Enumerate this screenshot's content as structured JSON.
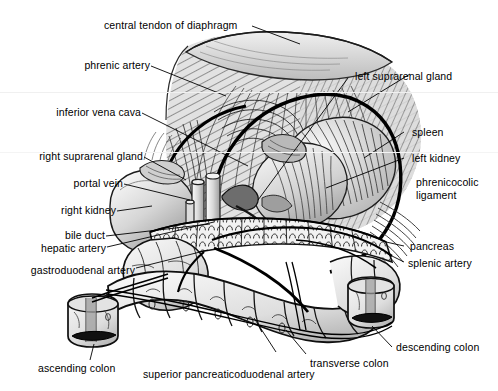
{
  "figure": {
    "type": "anatomical-line-illustration",
    "background_color": "#ffffff",
    "ink_color": "#000000",
    "leader_line_color": "#000000"
  },
  "labels": {
    "central_tendon_of_diaphragm": "central tendon of diaphragm",
    "phrenic_artery": "phrenic artery",
    "inferior_vena_cava": "inferior vena cava",
    "right_suprarenal_gland": "right suprarenal gland",
    "portal_vein": "portal vein",
    "right_kidney": "right kidney",
    "bile_duct": "bile duct",
    "hepatic_artery": "hepatic artery",
    "gastroduodenal_artery": "gastroduodenal artery",
    "ascending_colon": "ascending colon",
    "superior_pancreaticoduodenal_artery": "superior pancreaticoduodenal artery",
    "transverse_colon": "transverse colon",
    "descending_colon": "descending colon",
    "splenic_artery": "splenic artery",
    "pancreas": "pancreas",
    "phrenicocolic_ligament_line1": "phrenicocolic",
    "phrenicocolic_ligament_line2": "ligament",
    "left_kidney": "left kidney",
    "spleen": "spleen",
    "left_suprarenal_gland": "left suprarenal gland"
  },
  "structures": {
    "diaphragm": "diaphragm-dome",
    "central_tendon": "central-tendon-sheet",
    "spleen_body": "spleen",
    "left_kidney_body": "left-kidney",
    "right_kidney_body": "right-kidney",
    "pancreas_body": "pancreas",
    "duodenum_loop": "duodenum",
    "transverse_colon_body": "transverse-colon",
    "ascending_colon_stump": "ascending-colon-cut-end",
    "descending_colon_stump": "descending-colon-cut-end",
    "ivc_stump": "inferior-vena-cava-stump",
    "portal_vein_stump": "portal-vein-stump",
    "aorta_branch": "celiac-trunk"
  },
  "palette": {
    "organ_light": "#e8e8e8",
    "organ_mid": "#c9c9c9",
    "organ_dark": "#9a9a9a",
    "shadow": "#6e6e6e",
    "lumen": "#1a1a1a"
  }
}
